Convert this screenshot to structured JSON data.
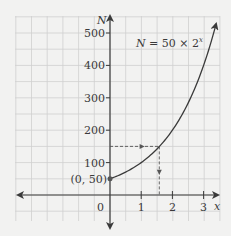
{
  "chart_data": {
    "type": "line",
    "title": "",
    "equation": "N = 50 × 2^x",
    "equation_parts": {
      "lhs": "N = 50 × 2",
      "exp": "x"
    },
    "xlabel": "x",
    "ylabel": "N",
    "xlim": [
      -3.5,
      3.5
    ],
    "ylim": [
      -100,
      560
    ],
    "x_ticks": [
      0,
      1,
      2,
      3
    ],
    "x_tick_labels": [
      "0",
      "1",
      "2",
      "3"
    ],
    "y_ticks": [
      100,
      200,
      300,
      400,
      500
    ],
    "y_tick_labels": [
      "100",
      "200",
      "300",
      "400",
      "500"
    ],
    "grid": true,
    "series": [
      {
        "name": "N = 50 × 2^x",
        "x": [
          0,
          0.5,
          1,
          1.5,
          2,
          2.5,
          3,
          3.4
        ],
        "values": [
          50,
          70.7,
          100,
          141.4,
          200,
          282.8,
          400,
          527.8
        ]
      }
    ],
    "annotations": [
      {
        "type": "point",
        "x": 0,
        "y": 50,
        "label": "(0, 50)"
      },
      {
        "type": "dashed-guide",
        "from": [
          0,
          150
        ],
        "to": [
          1.58,
          150
        ],
        "arrow": "right"
      },
      {
        "type": "dashed-guide",
        "from": [
          1.58,
          150
        ],
        "to": [
          1.58,
          0
        ],
        "arrow": "down"
      }
    ],
    "colors": {
      "background": "#f2f2f1",
      "grid": "#cfcfcf",
      "axis": "#3a3a3a",
      "curve": "#3a3a3a",
      "guide": "#555555"
    }
  }
}
